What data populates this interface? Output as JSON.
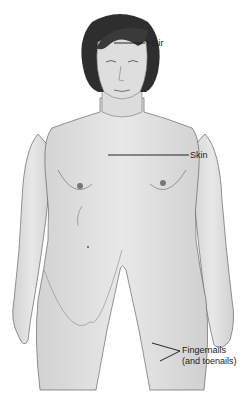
{
  "diagram": {
    "labels": [
      {
        "id": "hair",
        "text": "Hair"
      },
      {
        "id": "skin",
        "text": "Skin"
      },
      {
        "id": "nails",
        "line1": "Fingernails",
        "line2": "(and toenails)"
      }
    ],
    "colors": {
      "skin_fill": "#e4e4e4",
      "skin_shade": "#cfcfcf",
      "outline": "#555555",
      "hair": "#2e2e2e",
      "leader_line": "#111111",
      "label_text": "#222222",
      "background": "#ffffff"
    }
  }
}
